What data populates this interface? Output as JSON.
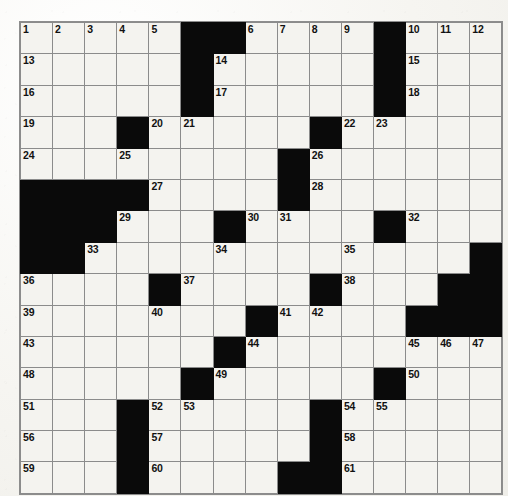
{
  "puzzle": {
    "title": "Crossword Puzzle Grid",
    "rows": 15,
    "cols": 15,
    "colors": {
      "block": "#0a0a0a",
      "cell": "#f4f3ef",
      "grid_line": "#8b8b8b",
      "number": "#111111",
      "paper": "#efeee9"
    },
    "grid": [
      [
        {
          "n": "1",
          "b": false
        },
        {
          "n": "2",
          "b": false
        },
        {
          "n": "3",
          "b": false
        },
        {
          "n": "4",
          "b": false
        },
        {
          "n": "5",
          "b": false
        },
        {
          "n": "",
          "b": true
        },
        {
          "n": "",
          "b": true
        },
        {
          "n": "6",
          "b": false
        },
        {
          "n": "7",
          "b": false
        },
        {
          "n": "8",
          "b": false
        },
        {
          "n": "9",
          "b": false
        },
        {
          "n": "",
          "b": true
        },
        {
          "n": "10",
          "b": false
        },
        {
          "n": "11",
          "b": false
        },
        {
          "n": "12",
          "b": false
        }
      ],
      [
        {
          "n": "13",
          "b": false
        },
        {
          "n": "",
          "b": false
        },
        {
          "n": "",
          "b": false
        },
        {
          "n": "",
          "b": false
        },
        {
          "n": "",
          "b": false
        },
        {
          "n": "",
          "b": true
        },
        {
          "n": "14",
          "b": false
        },
        {
          "n": "",
          "b": false
        },
        {
          "n": "",
          "b": false
        },
        {
          "n": "",
          "b": false
        },
        {
          "n": "",
          "b": false
        },
        {
          "n": "",
          "b": true
        },
        {
          "n": "15",
          "b": false
        },
        {
          "n": "",
          "b": false
        },
        {
          "n": "",
          "b": false
        }
      ],
      [
        {
          "n": "16",
          "b": false
        },
        {
          "n": "",
          "b": false
        },
        {
          "n": "",
          "b": false
        },
        {
          "n": "",
          "b": false
        },
        {
          "n": "",
          "b": false
        },
        {
          "n": "",
          "b": true
        },
        {
          "n": "17",
          "b": false
        },
        {
          "n": "",
          "b": false
        },
        {
          "n": "",
          "b": false
        },
        {
          "n": "",
          "b": false
        },
        {
          "n": "",
          "b": false
        },
        {
          "n": "",
          "b": true
        },
        {
          "n": "18",
          "b": false
        },
        {
          "n": "",
          "b": false
        },
        {
          "n": "",
          "b": false
        }
      ],
      [
        {
          "n": "19",
          "b": false
        },
        {
          "n": "",
          "b": false
        },
        {
          "n": "",
          "b": false
        },
        {
          "n": "",
          "b": true
        },
        {
          "n": "20",
          "b": false
        },
        {
          "n": "21",
          "b": false
        },
        {
          "n": "",
          "b": false
        },
        {
          "n": "",
          "b": false
        },
        {
          "n": "",
          "b": false
        },
        {
          "n": "",
          "b": true
        },
        {
          "n": "22",
          "b": false
        },
        {
          "n": "23",
          "b": false
        },
        {
          "n": "",
          "b": false
        },
        {
          "n": "",
          "b": false
        },
        {
          "n": "",
          "b": false
        }
      ],
      [
        {
          "n": "24",
          "b": false
        },
        {
          "n": "",
          "b": false
        },
        {
          "n": "",
          "b": false
        },
        {
          "n": "25",
          "b": false
        },
        {
          "n": "",
          "b": false
        },
        {
          "n": "",
          "b": false
        },
        {
          "n": "",
          "b": false
        },
        {
          "n": "",
          "b": false
        },
        {
          "n": "",
          "b": true
        },
        {
          "n": "26",
          "b": false
        },
        {
          "n": "",
          "b": false
        },
        {
          "n": "",
          "b": false
        },
        {
          "n": "",
          "b": false
        },
        {
          "n": "",
          "b": false
        },
        {
          "n": "",
          "b": false
        }
      ],
      [
        {
          "n": "",
          "b": true
        },
        {
          "n": "",
          "b": true
        },
        {
          "n": "",
          "b": true
        },
        {
          "n": "",
          "b": true
        },
        {
          "n": "27",
          "b": false
        },
        {
          "n": "",
          "b": false
        },
        {
          "n": "",
          "b": false
        },
        {
          "n": "",
          "b": false
        },
        {
          "n": "",
          "b": true
        },
        {
          "n": "28",
          "b": false
        },
        {
          "n": "",
          "b": false
        },
        {
          "n": "",
          "b": false
        },
        {
          "n": "",
          "b": false
        },
        {
          "n": "",
          "b": false
        },
        {
          "n": "",
          "b": false
        }
      ],
      [
        {
          "n": "",
          "b": true
        },
        {
          "n": "",
          "b": true
        },
        {
          "n": "",
          "b": true
        },
        {
          "n": "29",
          "b": false
        },
        {
          "n": "",
          "b": false
        },
        {
          "n": "",
          "b": false
        },
        {
          "n": "",
          "b": true
        },
        {
          "n": "30",
          "b": false
        },
        {
          "n": "31",
          "b": false
        },
        {
          "n": "",
          "b": false
        },
        {
          "n": "",
          "b": false
        },
        {
          "n": "",
          "b": true
        },
        {
          "n": "32",
          "b": false
        },
        {
          "n": "",
          "b": false
        },
        {
          "n": "",
          "b": false
        }
      ],
      [
        {
          "n": "",
          "b": true
        },
        {
          "n": "",
          "b": true
        },
        {
          "n": "33",
          "b": false
        },
        {
          "n": "",
          "b": false
        },
        {
          "n": "",
          "b": false
        },
        {
          "n": "",
          "b": false
        },
        {
          "n": "34",
          "b": false
        },
        {
          "n": "",
          "b": false
        },
        {
          "n": "",
          "b": false
        },
        {
          "n": "",
          "b": false
        },
        {
          "n": "35",
          "b": false
        },
        {
          "n": "",
          "b": false
        },
        {
          "n": "",
          "b": false
        },
        {
          "n": "",
          "b": false
        },
        {
          "n": "",
          "b": true
        }
      ],
      [
        {
          "n": "36",
          "b": false
        },
        {
          "n": "",
          "b": false
        },
        {
          "n": "",
          "b": false
        },
        {
          "n": "",
          "b": false
        },
        {
          "n": "",
          "b": true
        },
        {
          "n": "37",
          "b": false
        },
        {
          "n": "",
          "b": false
        },
        {
          "n": "",
          "b": false
        },
        {
          "n": "",
          "b": false
        },
        {
          "n": "",
          "b": true
        },
        {
          "n": "38",
          "b": false
        },
        {
          "n": "",
          "b": false
        },
        {
          "n": "",
          "b": false
        },
        {
          "n": "",
          "b": true
        },
        {
          "n": "",
          "b": true
        }
      ],
      [
        {
          "n": "39",
          "b": false
        },
        {
          "n": "",
          "b": false
        },
        {
          "n": "",
          "b": false
        },
        {
          "n": "",
          "b": false
        },
        {
          "n": "40",
          "b": false
        },
        {
          "n": "",
          "b": false
        },
        {
          "n": "",
          "b": false
        },
        {
          "n": "",
          "b": true
        },
        {
          "n": "41",
          "b": false
        },
        {
          "n": "42",
          "b": false
        },
        {
          "n": "",
          "b": false
        },
        {
          "n": "",
          "b": false
        },
        {
          "n": "",
          "b": true
        },
        {
          "n": "",
          "b": true
        },
        {
          "n": "",
          "b": true
        }
      ],
      [
        {
          "n": "43",
          "b": false
        },
        {
          "n": "",
          "b": false
        },
        {
          "n": "",
          "b": false
        },
        {
          "n": "",
          "b": false
        },
        {
          "n": "",
          "b": false
        },
        {
          "n": "",
          "b": false
        },
        {
          "n": "",
          "b": true
        },
        {
          "n": "44",
          "b": false
        },
        {
          "n": "",
          "b": false
        },
        {
          "n": "",
          "b": false
        },
        {
          "n": "",
          "b": false
        },
        {
          "n": "",
          "b": false
        },
        {
          "n": "45",
          "b": false
        },
        {
          "n": "46",
          "b": false
        },
        {
          "n": "47",
          "b": false
        }
      ],
      [
        {
          "n": "48",
          "b": false
        },
        {
          "n": "",
          "b": false
        },
        {
          "n": "",
          "b": false
        },
        {
          "n": "",
          "b": false
        },
        {
          "n": "",
          "b": false
        },
        {
          "n": "",
          "b": true
        },
        {
          "n": "49",
          "b": false
        },
        {
          "n": "",
          "b": false
        },
        {
          "n": "",
          "b": false
        },
        {
          "n": "",
          "b": false
        },
        {
          "n": "",
          "b": false
        },
        {
          "n": "",
          "b": true
        },
        {
          "n": "50",
          "b": false
        },
        {
          "n": "",
          "b": false
        },
        {
          "n": "",
          "b": false
        }
      ],
      [
        {
          "n": "51",
          "b": false
        },
        {
          "n": "",
          "b": false
        },
        {
          "n": "",
          "b": false
        },
        {
          "n": "",
          "b": true
        },
        {
          "n": "52",
          "b": false
        },
        {
          "n": "53",
          "b": false
        },
        {
          "n": "",
          "b": false
        },
        {
          "n": "",
          "b": false
        },
        {
          "n": "",
          "b": false
        },
        {
          "n": "",
          "b": true
        },
        {
          "n": "54",
          "b": false
        },
        {
          "n": "55",
          "b": false
        },
        {
          "n": "",
          "b": false
        },
        {
          "n": "",
          "b": false
        },
        {
          "n": "",
          "b": false
        }
      ],
      [
        {
          "n": "56",
          "b": false
        },
        {
          "n": "",
          "b": false
        },
        {
          "n": "",
          "b": false
        },
        {
          "n": "",
          "b": true
        },
        {
          "n": "57",
          "b": false
        },
        {
          "n": "",
          "b": false
        },
        {
          "n": "",
          "b": false
        },
        {
          "n": "",
          "b": false
        },
        {
          "n": "",
          "b": false
        },
        {
          "n": "",
          "b": true
        },
        {
          "n": "58",
          "b": false
        },
        {
          "n": "",
          "b": false
        },
        {
          "n": "",
          "b": false
        },
        {
          "n": "",
          "b": false
        },
        {
          "n": "",
          "b": false
        }
      ],
      [
        {
          "n": "59",
          "b": false
        },
        {
          "n": "",
          "b": false
        },
        {
          "n": "",
          "b": false
        },
        {
          "n": "",
          "b": true
        },
        {
          "n": "60",
          "b": false
        },
        {
          "n": "",
          "b": false
        },
        {
          "n": "",
          "b": false
        },
        {
          "n": "",
          "b": false
        },
        {
          "n": "",
          "b": true
        },
        {
          "n": "",
          "b": true
        },
        {
          "n": "61",
          "b": false
        },
        {
          "n": "",
          "b": false
        },
        {
          "n": "",
          "b": false
        },
        {
          "n": "",
          "b": false
        },
        {
          "n": "",
          "b": false
        }
      ]
    ]
  }
}
